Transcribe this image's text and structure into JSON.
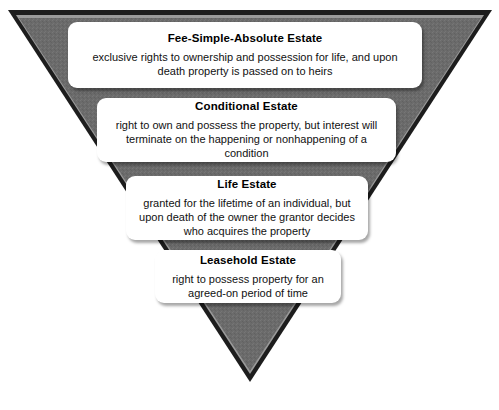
{
  "diagram": {
    "name": "estates-in-land-inverted-pyramid",
    "shape": "inverted-triangle",
    "colors": {
      "triangle_fill": "#6b6b6b",
      "triangle_border_dark": "#1c1c1c",
      "triangle_inner_highlight": "#8a8a8a",
      "card_background": "#ffffff",
      "text": "#111111",
      "page_background": "#ffffff"
    },
    "levels": [
      {
        "title": "Fee-Simple-Absolute Estate",
        "description": "exclusive rights to ownership and possession for life, and upon death property is passed on to heirs"
      },
      {
        "title": "Conditional Estate",
        "description": "right to own and possess the property, but interest will terminate on the happening or nonhappening of a condition"
      },
      {
        "title": "Life Estate",
        "description": "granted for the lifetime of an individual, but upon death of the owner the grantor decides who acquires the property"
      },
      {
        "title": "Leasehold Estate",
        "description": "right to possess property for an agreed-on period of time"
      }
    ]
  }
}
